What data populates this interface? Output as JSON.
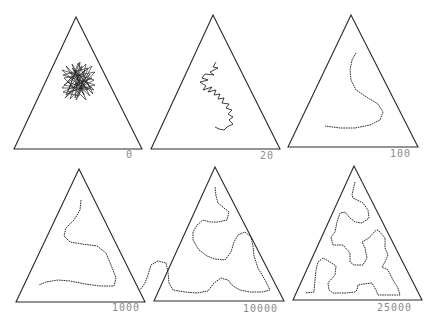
{
  "figure": {
    "title": "",
    "stroke_color": "#2a2a2a",
    "label_color": "#8a8a8a",
    "panels": [
      {
        "label": "0",
        "triangle": [
          [
            76,
            17
          ],
          [
            14,
            149
          ],
          [
            142,
            149
          ]
        ],
        "label_pos": [
          126,
          150
        ],
        "path_style": "tangle",
        "path": [
          [
            70,
            72
          ],
          [
            88,
            90
          ],
          [
            64,
            85
          ],
          [
            92,
            66
          ],
          [
            75,
            98
          ],
          [
            80,
            62
          ],
          [
            66,
            95
          ],
          [
            94,
            80
          ],
          [
            62,
            70
          ],
          [
            90,
            96
          ],
          [
            72,
            64
          ],
          [
            86,
            100
          ],
          [
            64,
            78
          ],
          [
            95,
            72
          ],
          [
            70,
            99
          ],
          [
            82,
            66
          ],
          [
            62,
            88
          ],
          [
            91,
            88
          ],
          [
            74,
            70
          ],
          [
            84,
            95
          ],
          [
            66,
            66
          ],
          [
            93,
            94
          ],
          [
            78,
            63
          ],
          [
            68,
            92
          ],
          [
            95,
            85
          ],
          [
            63,
            75
          ],
          [
            88,
            68
          ],
          [
            76,
            100
          ],
          [
            90,
            74
          ],
          [
            65,
            98
          ],
          [
            80,
            80
          ],
          [
            72,
            68
          ],
          [
            94,
            90
          ],
          [
            67,
            82
          ],
          [
            86,
            64
          ],
          [
            79,
            96
          ],
          [
            63,
            92
          ],
          [
            92,
            78
          ],
          [
            70,
            86
          ],
          [
            85,
            70
          ],
          [
            76,
            88
          ],
          [
            81,
            75
          ]
        ]
      },
      {
        "label": "20",
        "triangle": [
          [
            213,
            15
          ],
          [
            151,
            149
          ],
          [
            280,
            149
          ]
        ],
        "label_pos": [
          260,
          151
        ],
        "path_style": "jagged",
        "path": [
          [
            216,
            62
          ],
          [
            213,
            67
          ],
          [
            218,
            68
          ],
          [
            210,
            72
          ],
          [
            214,
            75
          ],
          [
            205,
            74
          ],
          [
            202,
            78
          ],
          [
            208,
            80
          ],
          [
            200,
            82
          ],
          [
            206,
            86
          ],
          [
            203,
            90
          ],
          [
            212,
            87
          ],
          [
            208,
            92
          ],
          [
            216,
            90
          ],
          [
            214,
            95
          ],
          [
            220,
            94
          ],
          [
            218,
            99
          ],
          [
            224,
            98
          ],
          [
            222,
            103
          ],
          [
            229,
            104
          ],
          [
            226,
            108
          ],
          [
            232,
            110
          ],
          [
            228,
            114
          ],
          [
            233,
            117
          ],
          [
            229,
            120
          ],
          [
            233,
            124
          ],
          [
            227,
            127
          ],
          [
            224,
            130
          ],
          [
            219,
            129
          ],
          [
            215,
            127
          ]
        ]
      },
      {
        "label": "100",
        "triangle": [
          [
            351,
            15
          ],
          [
            288,
            147
          ],
          [
            418,
            147
          ]
        ],
        "label_pos": [
          390,
          149
        ],
        "path_style": "dotted",
        "path": [
          [
            356,
            53
          ],
          [
            352,
            60
          ],
          [
            350,
            70
          ],
          [
            351,
            80
          ],
          [
            356,
            90
          ],
          [
            368,
            98
          ],
          [
            378,
            104
          ],
          [
            383,
            112
          ],
          [
            380,
            120
          ],
          [
            370,
            125
          ],
          [
            355,
            128
          ],
          [
            340,
            128
          ],
          [
            325,
            126
          ]
        ]
      },
      {
        "label": "1000",
        "triangle": [
          [
            79,
            169
          ],
          [
            16,
            302
          ],
          [
            145,
            302
          ]
        ],
        "label_pos": [
          112,
          303
        ],
        "path_style": "dotted",
        "path": [
          [
            81,
            200
          ],
          [
            80,
            210
          ],
          [
            74,
            220
          ],
          [
            66,
            228
          ],
          [
            64,
            236
          ],
          [
            70,
            242
          ],
          [
            82,
            244
          ],
          [
            97,
            246
          ],
          [
            106,
            253
          ],
          [
            111,
            265
          ],
          [
            116,
            278
          ],
          [
            114,
            286
          ],
          [
            100,
            286
          ],
          [
            85,
            284
          ],
          [
            70,
            281
          ],
          [
            58,
            280
          ],
          [
            46,
            282
          ],
          [
            39,
            285
          ]
        ]
      },
      {
        "label": "10000",
        "triangle": [
          [
            215,
            167
          ],
          [
            154,
            301
          ],
          [
            284,
            301
          ]
        ],
        "label_pos": [
          243,
          304
        ],
        "path_style": "dotted",
        "path": [
          [
            215,
            187
          ],
          [
            216,
            196
          ],
          [
            218,
            203
          ],
          [
            224,
            208
          ],
          [
            229,
            212
          ],
          [
            227,
            220
          ],
          [
            218,
            222
          ],
          [
            210,
            222
          ],
          [
            203,
            220
          ],
          [
            197,
            225
          ],
          [
            193,
            232
          ],
          [
            193,
            240
          ],
          [
            199,
            250
          ],
          [
            207,
            256
          ],
          [
            215,
            259
          ],
          [
            225,
            260
          ],
          [
            231,
            252
          ],
          [
            234,
            242
          ],
          [
            238,
            235
          ],
          [
            245,
            232
          ],
          [
            251,
            237
          ],
          [
            253,
            246
          ],
          [
            254,
            256
          ],
          [
            258,
            268
          ],
          [
            265,
            280
          ],
          [
            270,
            290
          ],
          [
            262,
            292
          ],
          [
            250,
            292
          ],
          [
            240,
            290
          ],
          [
            233,
            286
          ],
          [
            228,
            280
          ],
          [
            221,
            278
          ],
          [
            214,
            283
          ],
          [
            208,
            291
          ],
          [
            197,
            293
          ],
          [
            185,
            292
          ],
          [
            173,
            290
          ],
          [
            169,
            283
          ],
          [
            168,
            272
          ],
          [
            166,
            263
          ],
          [
            158,
            261
          ],
          [
            151,
            265
          ],
          [
            148,
            275
          ],
          [
            145,
            283
          ],
          [
            140,
            290
          ]
        ]
      },
      {
        "label": "25000",
        "triangle": [
          [
            354,
            166
          ],
          [
            293,
            300
          ],
          [
            422,
            300
          ]
        ],
        "label_pos": [
          377,
          303
        ],
        "path_style": "dotted",
        "path": [
          [
            355,
            182
          ],
          [
            352,
            195
          ],
          [
            353,
            198
          ],
          [
            363,
            203
          ],
          [
            368,
            210
          ],
          [
            369,
            218
          ],
          [
            362,
            223
          ],
          [
            355,
            222
          ],
          [
            350,
            218
          ],
          [
            345,
            212
          ],
          [
            340,
            213
          ],
          [
            337,
            222
          ],
          [
            335,
            232
          ],
          [
            331,
            237
          ],
          [
            333,
            245
          ],
          [
            343,
            245
          ],
          [
            350,
            253
          ],
          [
            350,
            262
          ],
          [
            354,
            265
          ],
          [
            363,
            265
          ],
          [
            367,
            258
          ],
          [
            365,
            248
          ],
          [
            362,
            242
          ],
          [
            369,
            238
          ],
          [
            375,
            231
          ],
          [
            378,
            230
          ],
          [
            385,
            238
          ],
          [
            385,
            248
          ],
          [
            388,
            255
          ],
          [
            385,
            262
          ],
          [
            382,
            267
          ],
          [
            388,
            270
          ],
          [
            393,
            280
          ],
          [
            398,
            288
          ],
          [
            400,
            295
          ],
          [
            386,
            295
          ],
          [
            378,
            295
          ],
          [
            376,
            290
          ],
          [
            372,
            283
          ],
          [
            363,
            284
          ],
          [
            358,
            285
          ],
          [
            357,
            290
          ],
          [
            355,
            292
          ],
          [
            346,
            293
          ],
          [
            333,
            293
          ],
          [
            329,
            290
          ],
          [
            328,
            283
          ],
          [
            335,
            275
          ],
          [
            336,
            266
          ],
          [
            330,
            262
          ],
          [
            323,
            258
          ],
          [
            318,
            262
          ],
          [
            316,
            270
          ],
          [
            315,
            280
          ],
          [
            314,
            292
          ],
          [
            305,
            293
          ]
        ]
      }
    ]
  }
}
